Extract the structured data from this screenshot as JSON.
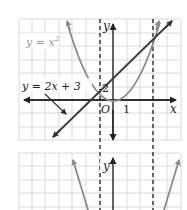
{
  "figure": {
    "top_panel": {
      "labels": {
        "parabola": "y = x²",
        "parabola_base": "y = x",
        "parabola_exp": "2",
        "line": "y = 2x + 3",
        "y_axis": "y",
        "x_axis": "x",
        "origin": "O",
        "x_tick": "1",
        "y_tick": "2"
      },
      "curves": [
        {
          "name": "parabola",
          "equation": "y = x^2",
          "color": "#8a8a8a"
        },
        {
          "name": "line",
          "equation": "y = 2x + 3",
          "color": "#3a3a3a"
        }
      ],
      "intersections": [
        {
          "x": -1,
          "y": 1
        },
        {
          "x": 3,
          "y": 9
        }
      ],
      "dashed_verticals": [
        -1,
        3
      ]
    },
    "bottom_panel": {
      "labels": {
        "y_axis": "y"
      }
    },
    "colors": {
      "grid": "#cfcfcf",
      "axis": "#222222",
      "parabola": "#8a8a8a",
      "line": "#3a3a3a",
      "dashed": "#444444",
      "label_gray": "#9a9a9a"
    }
  }
}
